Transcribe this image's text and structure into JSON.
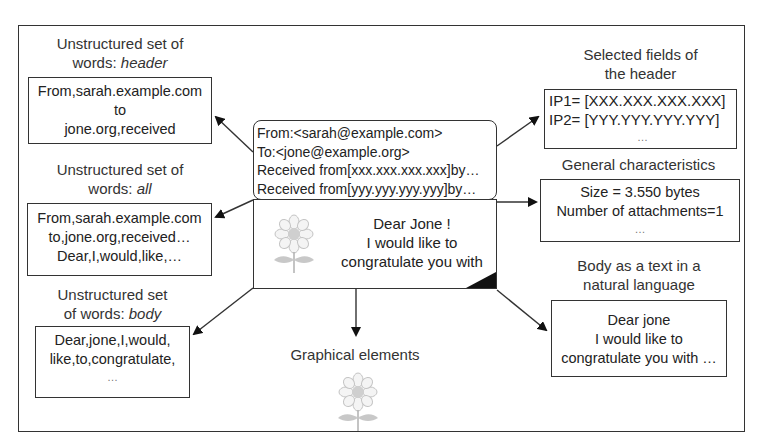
{
  "diagram": {
    "center_email": {
      "header_lines": [
        "From:<sarah@example.com>",
        "To:<jone@example.org>",
        "Received from[xxx.xxx.xxx.xxx]by…",
        "Received from[yyy.yyy.yyy.yyy]by…"
      ],
      "body_lines": [
        "Dear Jone !",
        "I would like to",
        "congratulate you with"
      ],
      "icon": "flower-icon"
    },
    "left": [
      {
        "label_lines": [
          "Unstructured set of",
          "words: "
        ],
        "label_italic": "header",
        "content_lines": [
          "From,sarah.example.com",
          "to",
          "jone.org,received"
        ]
      },
      {
        "label_lines": [
          "Unstructured set of",
          "words: "
        ],
        "label_italic": "all",
        "content_lines": [
          "From,sarah.example.com",
          "to,jone.org,received…",
          "Dear,I,would,like,…"
        ]
      },
      {
        "label_lines": [
          "Unstructured set",
          "of words: "
        ],
        "label_italic": "body",
        "content_lines": [
          "Dear,jone,I,would,",
          "like,to,congratulate,",
          "…"
        ]
      }
    ],
    "right": [
      {
        "label_lines": [
          "Selected fields of",
          "the header"
        ],
        "content_lines": [
          "IP1= [XXX.XXX.XXX.XXX]",
          "IP2= [YYY.YYY.YYY.YYY]",
          "…"
        ]
      },
      {
        "label_lines": [
          "General characteristics"
        ],
        "content_lines": [
          "Size = 3.550 bytes",
          "Number of attachments=1",
          "…"
        ]
      },
      {
        "label_lines": [
          "Body as a text in a",
          "natural language"
        ],
        "content_lines": [
          "Dear jone",
          "I would like to",
          "congratulate you with …"
        ]
      }
    ],
    "bottom": {
      "label": "Graphical elements",
      "icon": "flower-icon"
    },
    "colors": {
      "line": "#333333",
      "text": "#222222",
      "flower": "#bbbbbb"
    }
  }
}
